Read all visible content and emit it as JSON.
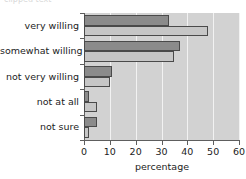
{
  "top_caption": "clipped text",
  "chart_data": {
    "type": "bar",
    "orientation": "horizontal",
    "title": "",
    "xlabel": "percentage",
    "ylabel": "",
    "categories": [
      "very willing",
      "somewhat willing",
      "not very willing",
      "not at all",
      "not sure"
    ],
    "series": [
      {
        "name": "series-1",
        "color": "#8b8b8b",
        "values": [
          33,
          37,
          11,
          2,
          5
        ]
      },
      {
        "name": "series-2",
        "color": "#c6c6c6",
        "values": [
          48,
          35,
          10,
          5,
          2
        ]
      }
    ],
    "xlim": [
      0,
      60
    ],
    "xticks": [
      0,
      10,
      20,
      30,
      40,
      50,
      60
    ],
    "xtick_labels": [
      "0",
      "10",
      "20",
      "30",
      "40",
      "50",
      "60"
    ],
    "grid": true,
    "grid_axis": "x",
    "grid_color": "#f2f2f2",
    "plot_background": "#d2d2d2",
    "legend": false
  }
}
